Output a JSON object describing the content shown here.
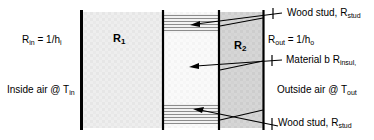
{
  "figure": {
    "width": 374,
    "height": 140
  },
  "labels": {
    "r_in": {
      "base": "R",
      "sub1": "in",
      "mid": " = 1/h",
      "sub2": "i"
    },
    "r_out": {
      "base": "R",
      "sub1": "out",
      "mid": " = 1/h",
      "sub2": "o"
    },
    "inside_air": {
      "base": "Inside air @ T",
      "sub": "in"
    },
    "outside_air": {
      "base": "Outside air @ T",
      "sub": "out"
    },
    "wood_stud_top": {
      "base": "Wood stud, R",
      "sub": "stud"
    },
    "wood_stud_bottom": {
      "base": "Wood stud, R",
      "sub": "stud"
    },
    "material_b": {
      "base": "Material b R",
      "sub": "insul,"
    }
  },
  "regions": {
    "r1": {
      "base": "R",
      "sub": "1"
    },
    "r2": {
      "base": "R",
      "sub": "2"
    }
  },
  "colors": {
    "line": "#000000",
    "text": "#000000",
    "background": "#ffffff",
    "layer1_fill": "#ececec",
    "layer_mid_fill": "#f7f7f7",
    "layer2_fill": "#d2d2d2",
    "stud_band": "#b8b8b8"
  }
}
